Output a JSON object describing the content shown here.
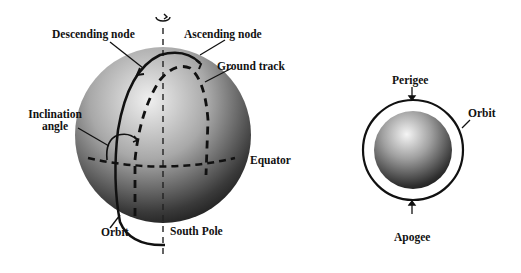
{
  "left_diagram": {
    "labels": {
      "descending_node": "Descending node",
      "ascending_node": "Ascending node",
      "ground_track": "Ground track",
      "inclination_line1": "Inclination",
      "inclination_line2": "angle",
      "equator": "Equator",
      "orbit": "Orbit",
      "south_pole": "South Pole"
    },
    "rotation_icon": "rotation-arrow-icon"
  },
  "right_diagram": {
    "labels": {
      "perigee": "Perigee",
      "orbit": "Orbit",
      "apogee": "Apogee"
    }
  },
  "colors": {
    "ink": "#111111",
    "sphere_light": "#f2f2f2",
    "sphere_dark": "#1a1a1a",
    "background": "#ffffff"
  }
}
